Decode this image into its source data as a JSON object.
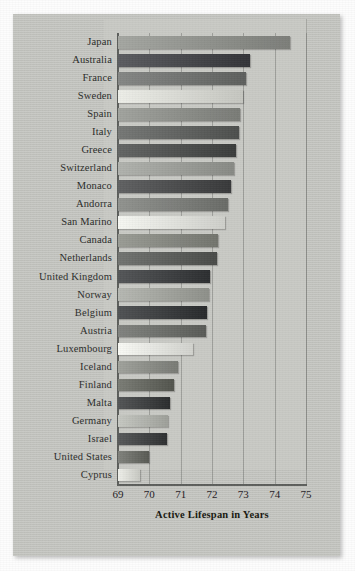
{
  "chart_data": {
    "type": "bar",
    "orientation": "horizontal",
    "title": "",
    "xlabel": "Active Lifespan in Years",
    "ylabel": "",
    "xlim": [
      69,
      75
    ],
    "xticks": [
      69,
      70,
      71,
      72,
      73,
      74,
      75
    ],
    "grid": true,
    "legend": null,
    "categories": [
      "Japan",
      "Australia",
      "France",
      "Sweden",
      "Spain",
      "Italy",
      "Greece",
      "Switzerland",
      "Monaco",
      "Andorra",
      "San Marino",
      "Canada",
      "Netherlands",
      "United Kingdom",
      "Norway",
      "Belgium",
      "Austria",
      "Luxembourg",
      "Iceland",
      "Finland",
      "Malta",
      "Germany",
      "Israel",
      "United States",
      "Cyprus"
    ],
    "values": [
      74.5,
      73.2,
      73.1,
      73.0,
      72.9,
      72.85,
      72.75,
      72.7,
      72.6,
      72.5,
      72.4,
      72.2,
      72.15,
      71.95,
      71.9,
      71.85,
      71.8,
      71.4,
      70.9,
      70.8,
      70.65,
      70.6,
      70.55,
      70.0,
      69.7
    ],
    "bar_colors": [
      "#8e908b",
      "#45464a",
      "#6f716f",
      "#d7d8d2",
      "#8b8d88",
      "#5f615f",
      "#4d4f4e",
      "#9a9c97",
      "#4a4b4c",
      "#7b7d79",
      "#e0e1dc",
      "#84867f",
      "#5b5d5a",
      "#3e4042",
      "#a0a29c",
      "#3a3c3e",
      "#6b6d69",
      "#e3e4df",
      "#8a8c86",
      "#64665f",
      "#3d3f40",
      "#b0b2ac",
      "#414344",
      "#6a6c66",
      "#d9dad4"
    ]
  },
  "axis": {
    "tick_labels": [
      "69",
      "70",
      "71",
      "72",
      "73",
      "74",
      "75"
    ],
    "x_title": "Active Lifespan in Years"
  }
}
